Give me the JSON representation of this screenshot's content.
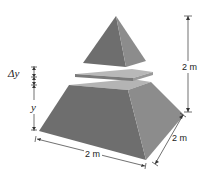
{
  "figure": {
    "labels": {
      "delta_y": "Δy",
      "y": "y",
      "height": "2 m",
      "base_width": "2 m",
      "base_depth": "2 m"
    },
    "colors": {
      "front_face": "#6e6e6e",
      "side_face": "#8c8c8c",
      "top_face": "#b4b4b4",
      "slab_front": "#7a7a7a",
      "slab_side": "#999999",
      "dimension_lines": "#333333"
    }
  }
}
